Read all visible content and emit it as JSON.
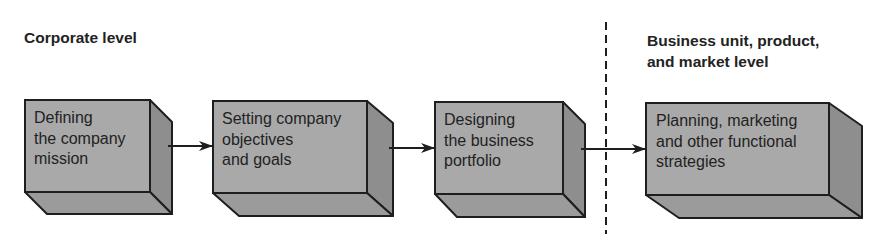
{
  "headings": {
    "corporate": "Corporate level",
    "business": "Business unit, product,\nand market level"
  },
  "boxes": [
    {
      "label": "Defining\nthe company\nmission"
    },
    {
      "label": "Setting company\nobjectives\nand goals"
    },
    {
      "label": "Designing\nthe business\nportfolio"
    },
    {
      "label": "Planning, marketing\nand other functional\nstrategies"
    }
  ],
  "colors": {
    "front_face": "#a9a9a9",
    "side_face": "#8e8e8e",
    "bottom_face": "#9b9b9b",
    "stroke": "#1e1e1e",
    "text": "#222222"
  }
}
